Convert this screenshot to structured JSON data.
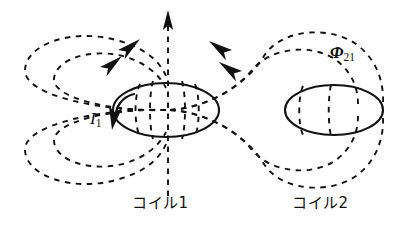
{
  "figure": {
    "name": "mutual-inductance-two-coils-magnetic-field-diagram",
    "background_color": "#ffffff",
    "stroke_color": "#111111"
  },
  "labels": {
    "current": {
      "symbol": "I",
      "subscript": "1",
      "icon": "current-arrow-icon"
    },
    "flux": {
      "symbol": "Φ",
      "subscript": "21"
    },
    "coil1_caption": "コイル1",
    "coil2_caption": "コイル2"
  },
  "elements": {
    "coil1": {
      "name": "coil-1-ellipse",
      "cx": 166,
      "cy": 110,
      "rx": 53,
      "ry": 27
    },
    "coil2": {
      "name": "coil-2-ellipse",
      "cx": 334,
      "cy": 110,
      "rx": 49,
      "ry": 25
    },
    "axis": {
      "name": "central-axis-dashed-arrow",
      "x": 168,
      "y_top": 12,
      "y_bottom": 196,
      "direction": "up"
    },
    "field_lines": [
      {
        "name": "field-line-left-outer",
        "side": "left",
        "arrow": "up-right"
      },
      {
        "name": "field-line-left-inner",
        "side": "left",
        "arrow": "up-right"
      },
      {
        "name": "field-line-right-outer",
        "side": "right",
        "arrow": "up-left"
      },
      {
        "name": "field-line-right-inner",
        "side": "right",
        "arrow": "up-left"
      }
    ]
  }
}
